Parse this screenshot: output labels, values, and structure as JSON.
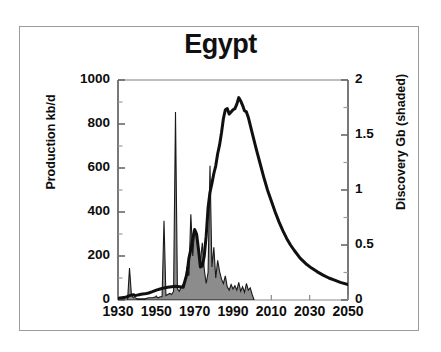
{
  "figure": {
    "title": "Egypt",
    "frame_color": "#9a9a9a",
    "background": "#ffffff"
  },
  "chart_data": {
    "type": "area",
    "title": "Egypt",
    "xlabel": "",
    "ylabel": "Production kb/d",
    "y2label": "Discovery Gb (shaded)",
    "xlim": [
      1930,
      2050
    ],
    "ylim": [
      0,
      1000
    ],
    "y2lim": [
      0,
      2
    ],
    "grid": false,
    "legend": "none",
    "xticks": [
      "1930",
      "1950",
      "1970",
      "1990",
      "2010",
      "2030",
      "2050"
    ],
    "xtick_values": [
      1930,
      1950,
      1970,
      1990,
      2010,
      2030,
      2050
    ],
    "yticks": [
      "0",
      "200",
      "400",
      "600",
      "800",
      "1000"
    ],
    "ytick_values": [
      0,
      200,
      400,
      600,
      800,
      1000
    ],
    "y2ticks": [
      "0",
      "0.5",
      "1",
      "1.5",
      "2"
    ],
    "y2tick_values": [
      0,
      0.5,
      1,
      1.5,
      2
    ],
    "minor_tick_interval_y": 100,
    "minor_tick_interval_y2": 0.25,
    "series": [
      {
        "name": "Production kb/d",
        "type": "line",
        "color": "#101010",
        "linewidth": 3,
        "axis": "left",
        "x": [
          1930,
          1932,
          1934,
          1936,
          1937,
          1938,
          1939,
          1940,
          1941,
          1942,
          1944,
          1946,
          1948,
          1950,
          1952,
          1954,
          1956,
          1958,
          1960,
          1962,
          1964,
          1966,
          1967,
          1968,
          1969,
          1970,
          1971,
          1972,
          1973,
          1974,
          1975,
          1976,
          1977,
          1978,
          1979,
          1980,
          1981,
          1982,
          1983,
          1984,
          1985,
          1986,
          1987,
          1988,
          1989,
          1990,
          1991,
          1992,
          1993,
          1994,
          1995,
          1996,
          1997,
          1998,
          1999,
          2000,
          2002,
          2004,
          2006,
          2008,
          2010,
          2012,
          2014,
          2016,
          2018,
          2020,
          2022,
          2025,
          2028,
          2031,
          2034,
          2037,
          2040,
          2043,
          2046,
          2050
        ],
        "y": [
          8,
          10,
          12,
          20,
          22,
          24,
          20,
          22,
          24,
          26,
          28,
          32,
          38,
          45,
          50,
          55,
          58,
          60,
          62,
          60,
          58,
          120,
          190,
          230,
          280,
          320,
          300,
          230,
          150,
          155,
          200,
          290,
          420,
          490,
          530,
          575,
          610,
          665,
          705,
          760,
          825,
          865,
          870,
          845,
          855,
          865,
          870,
          890,
          920,
          905,
          885,
          860,
          855,
          830,
          795,
          760,
          690,
          625,
          560,
          500,
          450,
          400,
          355,
          315,
          280,
          250,
          225,
          190,
          165,
          145,
          128,
          113,
          100,
          90,
          80,
          70
        ]
      },
      {
        "name": "Discovery Gb (shaded)",
        "type": "area",
        "fill_color": "#8c8c8c",
        "edge_color": "#1a1a1a",
        "axis": "right",
        "x": [
          1930,
          1935,
          1936,
          1937,
          1938,
          1939,
          1940,
          1942,
          1944,
          1946,
          1948,
          1950,
          1951,
          1952,
          1953,
          1954,
          1955,
          1956,
          1957,
          1958,
          1959,
          1960,
          1961,
          1962,
          1963,
          1964,
          1965,
          1966,
          1967,
          1968,
          1969,
          1970,
          1971,
          1972,
          1973,
          1974,
          1975,
          1976,
          1977,
          1978,
          1979,
          1980,
          1981,
          1982,
          1983,
          1984,
          1985,
          1986,
          1987,
          1988,
          1989,
          1990,
          1991,
          1992,
          1993,
          1994,
          1995,
          1996,
          1997,
          1998,
          1999,
          2000,
          2001
        ],
        "y": [
          0,
          0,
          0.29,
          0.05,
          0.02,
          0.02,
          0.01,
          0.01,
          0.01,
          0.02,
          0.02,
          0.03,
          0.02,
          0.03,
          0.03,
          0.72,
          0.04,
          0.05,
          0.06,
          0.05,
          0.08,
          1.71,
          0.1,
          0.08,
          0.12,
          0.14,
          0.18,
          0.3,
          0.22,
          0.78,
          0.4,
          0.65,
          0.58,
          0.45,
          0.35,
          0.52,
          0.28,
          0.15,
          0.25,
          1.22,
          0.3,
          0.48,
          0.2,
          0.36,
          0.26,
          0.19,
          0.15,
          0.22,
          0.12,
          0.09,
          0.14,
          0.1,
          0.13,
          0.09,
          0.16,
          0.08,
          0.12,
          0.07,
          0.15,
          0.09,
          0.11,
          0.05,
          0
        ]
      }
    ]
  }
}
